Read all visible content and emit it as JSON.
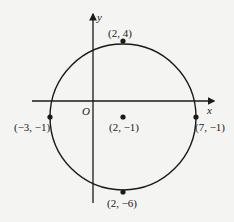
{
  "diagram": {
    "type": "circle-on-coordinate-plane",
    "axes": {
      "x_label": "x",
      "y_label": "y",
      "origin_label": "O"
    },
    "circle": {
      "center": "(2, −1)",
      "radius": 5
    },
    "points": [
      {
        "label": "(2, 4)"
      },
      {
        "label": "(−3, −1)"
      },
      {
        "label": "(2, −1)"
      },
      {
        "label": "(7, −1)"
      },
      {
        "label": "(2, −6)"
      }
    ]
  }
}
